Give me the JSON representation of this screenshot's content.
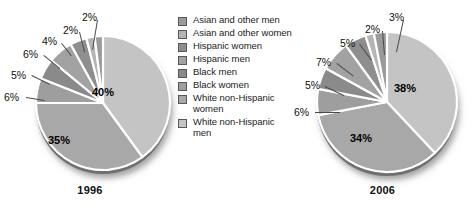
{
  "chart_data": {
    "type": "pie",
    "title": "",
    "legend_position": "center",
    "categories": [
      "Asian and other men",
      "Asian and other women",
      "Hispanic women",
      "Hispanic men",
      "Black men",
      "Black women",
      "White non-Hispanic women",
      "White non-Hispanic men"
    ],
    "series": [
      {
        "name": "1996",
        "values": [
          2,
          2,
          4,
          6,
          5,
          6,
          35,
          40
        ],
        "labels": [
          "2%",
          "2%",
          "4%",
          "6%",
          "5%",
          "6%",
          "35%",
          "40%"
        ]
      },
      {
        "name": "2006",
        "values": [
          3,
          2,
          5,
          7,
          5,
          6,
          34,
          38
        ],
        "labels": [
          "3%",
          "2%",
          "5%",
          "7%",
          "5%",
          "6%",
          "34%",
          "38%"
        ]
      }
    ]
  },
  "charts": [
    {
      "id": "1996",
      "year_label": "1996",
      "inside_labels": [
        {
          "text": "40%",
          "x": 92,
          "y": 87
        },
        {
          "text": "35%",
          "x": 48,
          "y": 135
        }
      ],
      "callouts": [
        {
          "text": "6%",
          "x": 4,
          "y": 92
        },
        {
          "text": "5%",
          "x": 11,
          "y": 70
        },
        {
          "text": "6%",
          "x": 23,
          "y": 49
        },
        {
          "text": "4%",
          "x": 42,
          "y": 36
        },
        {
          "text": "2%",
          "x": 63,
          "y": 25
        },
        {
          "text": "2%",
          "x": 82,
          "y": 12
        }
      ]
    },
    {
      "id": "2006",
      "year_label": "2006",
      "inside_labels": [
        {
          "text": "38%",
          "x": 102,
          "y": 83
        },
        {
          "text": "34%",
          "x": 58,
          "y": 133
        }
      ],
      "callouts": [
        {
          "text": "6%",
          "x": 2,
          "y": 107
        },
        {
          "text": "5%",
          "x": 13,
          "y": 80
        },
        {
          "text": "7%",
          "x": 24,
          "y": 57
        },
        {
          "text": "5%",
          "x": 48,
          "y": 38
        },
        {
          "text": "2%",
          "x": 73,
          "y": 24
        },
        {
          "text": "3%",
          "x": 97,
          "y": 12
        }
      ]
    }
  ],
  "legend": {
    "items": [
      {
        "label": "Asian and other men",
        "color": "#9a9a9a"
      },
      {
        "label": "Asian and other women",
        "color": "#b5b5b5"
      },
      {
        "label": "Hispanic women",
        "color": "#8e8e8e"
      },
      {
        "label": "Hispanic men",
        "color": "#a2a2a2"
      },
      {
        "label": "Black men",
        "color": "#8a8a8a"
      },
      {
        "label": "Black women",
        "color": "#9e9e9e"
      },
      {
        "label": "White non-Hispanic women",
        "color": "#a8a8a8"
      },
      {
        "label": "White non-Hispanic men",
        "color": "#c4c4c4"
      }
    ]
  },
  "colors": {
    "background": "#ffffff",
    "slice_separator": "#ffffff",
    "text": "#111111",
    "leader_line": "#4a4a4a"
  }
}
